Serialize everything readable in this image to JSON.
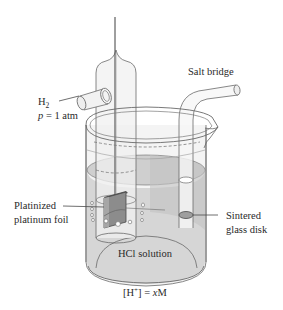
{
  "figure": {
    "labels": {
      "gas": "H",
      "gas_subscript": "2",
      "pressure_var": "p",
      "pressure_value": " = 1 atm",
      "salt_bridge": "Salt bridge",
      "foil_line1": "Platinized",
      "foil_line2": "platinum foil",
      "disk_line1": "Sintered",
      "disk_line2": "glass disk",
      "solution": "HCl solution",
      "concentration_open": "[H",
      "concentration_sup": "+",
      "concentration_mid": "] = ",
      "concentration_var": "x",
      "concentration_unit": "M"
    },
    "colors": {
      "solution_fill": "#d9d9d9",
      "solution_dark": "#c6c6c6",
      "glass_fill": "#f4f4f4",
      "foil_fill": "#8a8a8a",
      "outline": "#6a6a6a",
      "text": "#2a2a2a"
    }
  }
}
